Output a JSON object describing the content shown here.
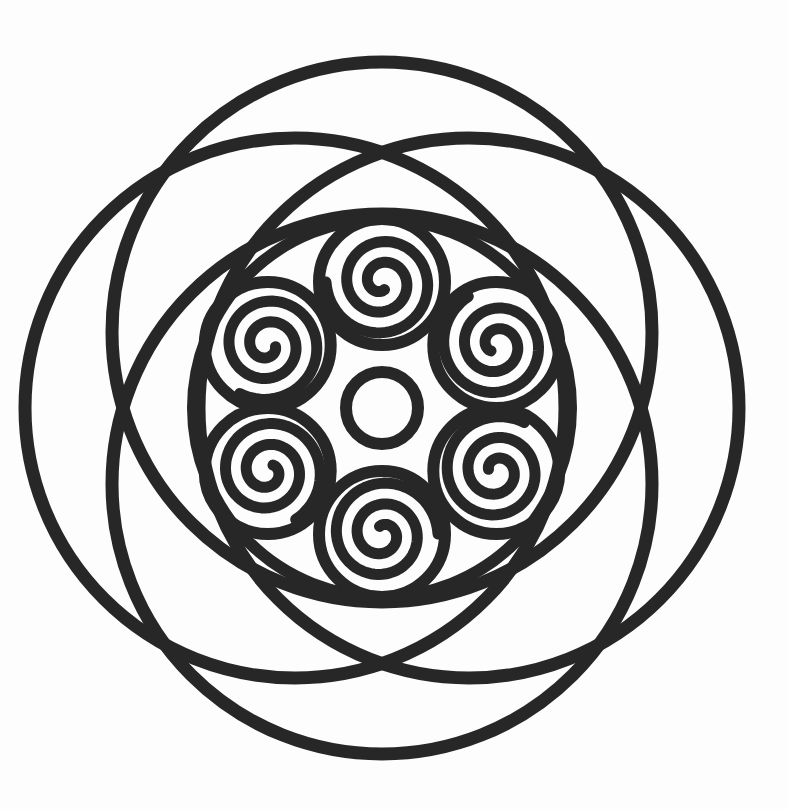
{
  "artwork": {
    "description": "Black-and-white mandala line drawing: four large overlapping circles forming a rosette, an inner boundary circle enclosing six spiral medallions arranged in a ring around a small central circle",
    "background_color": "#fdfdfd",
    "line_color": "#272727",
    "canvas": {
      "width": 788,
      "height": 809
    },
    "center": {
      "x": 382,
      "y": 408
    },
    "outer_circles": {
      "count": 4,
      "radius": 270,
      "offset_x": 87,
      "offset_y": 76,
      "stroke_width": 13,
      "positions": [
        "top",
        "right",
        "bottom",
        "left"
      ]
    },
    "inner_circle": {
      "radius": 189,
      "stroke_width": 12
    },
    "spiral_ring": {
      "count": 6,
      "ring_radius_x": 132,
      "ring_radius_y": 126,
      "medallion_radius": 63,
      "medallion_stroke_width": 12,
      "spiral_turns": 2.3,
      "spiral_inner_radius": 8,
      "spiral_outer_radius": 56,
      "spiral_stroke_width": 11,
      "start_angle_deg": -90,
      "positions": [
        "top",
        "upper-right",
        "lower-right",
        "bottom",
        "lower-left",
        "upper-left"
      ]
    },
    "center_circle": {
      "radius": 36,
      "stroke_width": 12
    }
  }
}
